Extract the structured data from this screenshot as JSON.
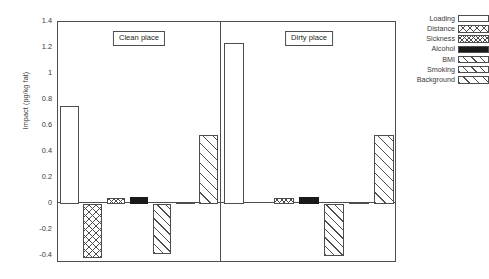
{
  "chart_data": {
    "type": "bar",
    "title": "",
    "xlabel": "",
    "ylabel": "Impact (pg/kg fat)",
    "ylim": [
      -0.45,
      1.4
    ],
    "yticks": [
      "1.4",
      "1.2",
      "1",
      "0.8",
      "0.6",
      "0.4",
      "0.2",
      "0",
      "-0.2",
      "-0.4"
    ],
    "ytick_values": [
      1.4,
      1.2,
      1.0,
      0.8,
      0.6,
      0.4,
      0.2,
      0,
      -0.2,
      -0.4
    ],
    "grid": false,
    "legend_position": "right",
    "panels": [
      {
        "name": "clean-place",
        "title": "Clean place",
        "categories": [
          "Loading",
          "Distance",
          "Sickness",
          "Alcohol",
          "BMI",
          "Smoking",
          "Background"
        ],
        "values": [
          0.755,
          -0.41,
          0.05,
          0.06,
          -0.38,
          0.02,
          0.53
        ]
      },
      {
        "name": "dirty-place",
        "title": "Dirty place",
        "categories": [
          "Loading",
          "Distance",
          "Sickness",
          "Alcohol",
          "BMI",
          "Smoking",
          "Background"
        ],
        "values": [
          1.24,
          0,
          0.05,
          0.06,
          -0.4,
          0.02,
          0.53
        ]
      }
    ],
    "series": [
      {
        "name": "Loading",
        "pattern": "empty",
        "values": [
          0.755,
          1.24
        ]
      },
      {
        "name": "Distance",
        "pattern": "crosshatch",
        "values": [
          -0.41,
          0
        ]
      },
      {
        "name": "Sickness",
        "pattern": "checker",
        "values": [
          0.05,
          0.05
        ]
      },
      {
        "name": "Alcohol",
        "pattern": "solid",
        "values": [
          0.06,
          0.06
        ]
      },
      {
        "name": "BMI",
        "pattern": "diag-up",
        "values": [
          -0.38,
          -0.4
        ]
      },
      {
        "name": "Smoking",
        "pattern": "diag-up",
        "values": [
          0.02,
          0.02
        ]
      },
      {
        "name": "Background",
        "pattern": "diag-up-wide",
        "values": [
          0.53,
          0.53
        ]
      }
    ],
    "legend": [
      {
        "label": "Loading",
        "pattern": "empty"
      },
      {
        "label": "Distance",
        "pattern": "crosshatch"
      },
      {
        "label": "Sickness",
        "pattern": "checker"
      },
      {
        "label": "Alcohol",
        "pattern": "solid"
      },
      {
        "label": "BMI",
        "pattern": "diag-up"
      },
      {
        "label": "Smoking",
        "pattern": "diag-up"
      },
      {
        "label": "Background",
        "pattern": "diag-up-wide"
      }
    ],
    "colors": {
      "axis": "#4d4d4d",
      "text": "#3a3a3a",
      "solid_fill": "#1a1a1a",
      "background": "#ffffff"
    }
  }
}
